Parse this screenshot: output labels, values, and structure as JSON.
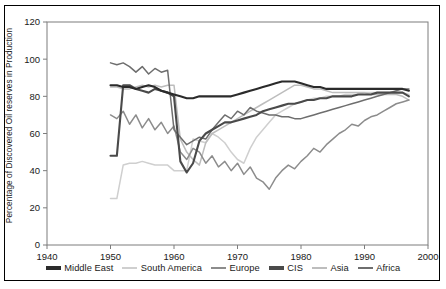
{
  "chart_data": {
    "type": "line",
    "title": "",
    "xlabel": "",
    "ylabel": "Percentage of Discovered Oil reserves in Production",
    "xlim": [
      1940,
      2000
    ],
    "ylim": [
      0,
      120
    ],
    "xticks": [
      1940,
      1950,
      1960,
      1970,
      1980,
      1990,
      2000
    ],
    "yticks": [
      0,
      20,
      40,
      60,
      80,
      100,
      120
    ],
    "grid": false,
    "legend_position": "bottom",
    "series": [
      {
        "name": "Middle East",
        "color": "#2b2b2b",
        "x": [
          1950,
          1951,
          1952,
          1953,
          1954,
          1955,
          1956,
          1957,
          1958,
          1959,
          1960,
          1961,
          1962,
          1963,
          1964,
          1965,
          1966,
          1967,
          1968,
          1969,
          1970,
          1971,
          1972,
          1973,
          1974,
          1975,
          1976,
          1977,
          1978,
          1979,
          1980,
          1981,
          1982,
          1983,
          1984,
          1985,
          1986,
          1987,
          1988,
          1989,
          1990,
          1991,
          1992,
          1993,
          1994,
          1995,
          1996,
          1997
        ],
        "values": [
          86,
          86,
          85,
          85,
          84,
          85,
          86,
          85,
          83,
          82,
          81,
          80,
          79,
          79,
          80,
          80,
          80,
          80,
          80,
          80,
          81,
          82,
          83,
          84,
          85,
          86,
          87,
          88,
          88,
          88,
          87,
          86,
          85,
          85,
          84,
          84,
          84,
          84,
          84,
          84,
          84,
          84,
          84,
          84,
          84,
          84,
          84,
          83
        ]
      },
      {
        "name": "South America",
        "color": "#cfcfcf",
        "x": [
          1950,
          1951,
          1952,
          1953,
          1954,
          1955,
          1956,
          1957,
          1958,
          1959,
          1960,
          1961,
          1962,
          1963,
          1964,
          1965,
          1966,
          1967,
          1968,
          1969,
          1970,
          1971,
          1972,
          1973,
          1974,
          1975,
          1976,
          1977,
          1978,
          1979,
          1980,
          1981,
          1982,
          1983,
          1984,
          1985,
          1986,
          1987,
          1988,
          1989,
          1990,
          1991,
          1992,
          1993,
          1994,
          1995,
          1996,
          1997
        ],
        "values": [
          25,
          25,
          43,
          44,
          44,
          45,
          44,
          43,
          43,
          43,
          40,
          40,
          40,
          57,
          56,
          55,
          60,
          58,
          55,
          50,
          46,
          44,
          52,
          58,
          62,
          66,
          70,
          72,
          74,
          76,
          77,
          78,
          79,
          79,
          80,
          80,
          80,
          81,
          81,
          81,
          82,
          82,
          82,
          82,
          82,
          82,
          82,
          81
        ]
      },
      {
        "name": "Europe",
        "color": "#8c8c8c",
        "x": [
          1950,
          1951,
          1952,
          1953,
          1954,
          1955,
          1956,
          1957,
          1958,
          1959,
          1960,
          1961,
          1962,
          1963,
          1964,
          1965,
          1966,
          1967,
          1968,
          1969,
          1970,
          1971,
          1972,
          1973,
          1974,
          1975,
          1976,
          1977,
          1978,
          1979,
          1980,
          1981,
          1982,
          1983,
          1984,
          1985,
          1986,
          1987,
          1988,
          1989,
          1990,
          1991,
          1992,
          1993,
          1994,
          1995,
          1996,
          1997
        ],
        "values": [
          70,
          68,
          72,
          65,
          70,
          63,
          68,
          62,
          66,
          60,
          64,
          50,
          46,
          52,
          50,
          44,
          48,
          42,
          45,
          40,
          44,
          38,
          42,
          36,
          34,
          30,
          36,
          40,
          43,
          41,
          45,
          48,
          52,
          50,
          54,
          57,
          60,
          62,
          65,
          64,
          67,
          69,
          70,
          72,
          74,
          76,
          77,
          78
        ]
      },
      {
        "name": "CIS",
        "color": "#4a4a4a",
        "x": [
          1950,
          1951,
          1952,
          1953,
          1954,
          1955,
          1956,
          1957,
          1958,
          1959,
          1960,
          1961,
          1962,
          1963,
          1964,
          1965,
          1966,
          1967,
          1968,
          1969,
          1970,
          1971,
          1972,
          1973,
          1974,
          1975,
          1976,
          1977,
          1978,
          1979,
          1980,
          1981,
          1982,
          1983,
          1984,
          1985,
          1986,
          1987,
          1988,
          1989,
          1990,
          1991,
          1992,
          1993,
          1994,
          1995,
          1996,
          1997
        ],
        "values": [
          48,
          48,
          86,
          86,
          84,
          83,
          82,
          84,
          83,
          82,
          80,
          45,
          39,
          44,
          56,
          60,
          62,
          64,
          66,
          66,
          67,
          68,
          69,
          70,
          72,
          73,
          74,
          75,
          76,
          76,
          77,
          78,
          78,
          79,
          79,
          80,
          80,
          80,
          80,
          81,
          81,
          81,
          82,
          82,
          82,
          82,
          82,
          80
        ]
      },
      {
        "name": "Asia",
        "color": "#bdbdbd",
        "x": [
          1950,
          1951,
          1952,
          1953,
          1954,
          1955,
          1956,
          1957,
          1958,
          1959,
          1960,
          1961,
          1962,
          1963,
          1964,
          1965,
          1966,
          1967,
          1968,
          1969,
          1970,
          1971,
          1972,
          1973,
          1974,
          1975,
          1976,
          1977,
          1978,
          1979,
          1980,
          1981,
          1982,
          1983,
          1984,
          1985,
          1986,
          1987,
          1988,
          1989,
          1990,
          1991,
          1992,
          1993,
          1994,
          1995,
          1996,
          1997
        ],
        "values": [
          85,
          85,
          84,
          84,
          85,
          86,
          85,
          86,
          85,
          86,
          86,
          57,
          50,
          46,
          43,
          55,
          60,
          62,
          64,
          66,
          68,
          70,
          72,
          74,
          76,
          78,
          80,
          82,
          84,
          86,
          86,
          85,
          84,
          84,
          83,
          82,
          82,
          82,
          82,
          82,
          82,
          81,
          81,
          81,
          81,
          81,
          80,
          78
        ]
      },
      {
        "name": "Africa",
        "color": "#6e6e6e",
        "x": [
          1950,
          1951,
          1952,
          1953,
          1954,
          1955,
          1956,
          1957,
          1958,
          1959,
          1960,
          1961,
          1962,
          1963,
          1964,
          1965,
          1966,
          1967,
          1968,
          1969,
          1970,
          1971,
          1972,
          1973,
          1974,
          1975,
          1976,
          1977,
          1978,
          1979,
          1980,
          1981,
          1982,
          1983,
          1984,
          1985,
          1986,
          1987,
          1988,
          1989,
          1990,
          1991,
          1992,
          1993,
          1994,
          1995,
          1996,
          1997
        ],
        "values": [
          98,
          97,
          98,
          96,
          93,
          96,
          92,
          95,
          93,
          94,
          62,
          58,
          54,
          56,
          58,
          57,
          62,
          66,
          70,
          68,
          72,
          70,
          74,
          72,
          71,
          70,
          70,
          69,
          69,
          68,
          68,
          69,
          70,
          71,
          72,
          73,
          74,
          75,
          76,
          77,
          78,
          79,
          80,
          81,
          82,
          83,
          84,
          84
        ]
      }
    ]
  },
  "axis": {
    "xticklabels": [
      "1940",
      "1950",
      "1960",
      "1970",
      "1980",
      "1990",
      "2000"
    ],
    "yticklabels": [
      "0",
      "20",
      "40",
      "60",
      "80",
      "100",
      "120"
    ],
    "ylabel_text": "Percentage of Discovered Oil reserves in Production"
  },
  "legend": {
    "items": [
      {
        "label": "Middle East",
        "color": "#2b2b2b"
      },
      {
        "label": "South America",
        "color": "#cfcfcf"
      },
      {
        "label": "Europe",
        "color": "#8c8c8c"
      },
      {
        "label": "CIS",
        "color": "#4a4a4a"
      },
      {
        "label": "Asia",
        "color": "#bdbdbd"
      },
      {
        "label": "Africa",
        "color": "#6e6e6e"
      }
    ]
  }
}
